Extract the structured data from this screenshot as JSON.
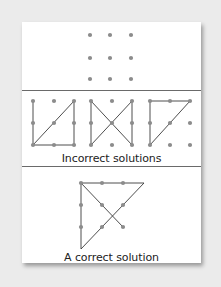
{
  "figure": {
    "colors": {
      "background": "#ebebeb",
      "card": "#ffffff",
      "dot": "#8c8c8c",
      "line": "#3a3a3a",
      "divider": "#6a6a6a"
    }
  },
  "panels": {
    "puzzle": {
      "dots": [
        [
          90,
          35
        ],
        [
          110,
          35
        ],
        [
          131,
          35
        ],
        [
          90,
          58
        ],
        [
          110,
          58
        ],
        [
          131,
          58
        ],
        [
          90,
          79
        ],
        [
          110,
          79
        ],
        [
          131,
          79
        ]
      ]
    },
    "incorrect": {
      "caption": "Incorrect solutions",
      "solutions": [
        {
          "dots": [
            [
              33,
              101
            ],
            [
              54,
              101
            ],
            [
              74,
              101
            ],
            [
              33,
              123
            ],
            [
              54,
              123
            ],
            [
              74,
              123
            ],
            [
              33,
              145
            ],
            [
              54,
              145
            ],
            [
              74,
              145
            ]
          ],
          "path": [
            [
              33,
              101
            ],
            [
              33,
              145
            ],
            [
              74,
              145
            ],
            [
              74,
              101
            ],
            [
              33,
              145
            ]
          ]
        },
        {
          "dots": [
            [
              91,
              101
            ],
            [
              112,
              101
            ],
            [
              132,
              101
            ],
            [
              91,
              123
            ],
            [
              112,
              123
            ],
            [
              132,
              123
            ],
            [
              91,
              145
            ],
            [
              112,
              145
            ],
            [
              132,
              145
            ]
          ],
          "path": [
            [
              91,
              145
            ],
            [
              91,
              101
            ],
            [
              132,
              145
            ],
            [
              132,
              101
            ],
            [
              91,
              145
            ]
          ]
        },
        {
          "dots": [
            [
              150,
              101
            ],
            [
              170,
              101
            ],
            [
              190,
              101
            ],
            [
              150,
              123
            ],
            [
              170,
              123
            ],
            [
              190,
              123
            ],
            [
              150,
              145
            ],
            [
              170,
              145
            ],
            [
              190,
              145
            ]
          ],
          "path": [
            [
              150,
              145
            ],
            [
              150,
              101
            ],
            [
              190,
              101
            ],
            [
              150,
              145
            ]
          ]
        }
      ]
    },
    "correct": {
      "caption": "A correct solution",
      "dots": [
        [
          81,
          183
        ],
        [
          102,
          183
        ],
        [
          123,
          183
        ],
        [
          81,
          205
        ],
        [
          102,
          205
        ],
        [
          123,
          205
        ],
        [
          81,
          227
        ],
        [
          102,
          227
        ],
        [
          123,
          227
        ]
      ],
      "path": [
        [
          123,
          227
        ],
        [
          81,
          183
        ],
        [
          144,
          183
        ],
        [
          81,
          249
        ],
        [
          81,
          183
        ]
      ]
    }
  }
}
